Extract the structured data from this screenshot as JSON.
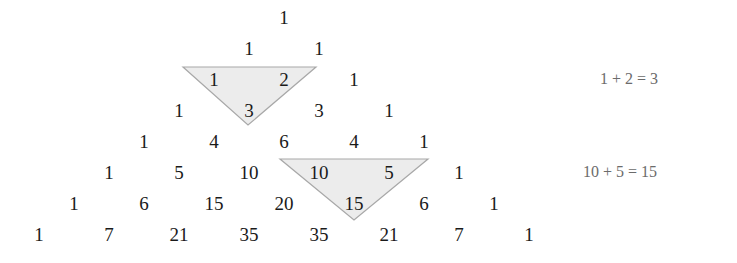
{
  "diagram": {
    "title": "",
    "triangle_rows": [
      [
        "1"
      ],
      [
        "1",
        "1"
      ],
      [
        "1",
        "2",
        "1"
      ],
      [
        "1",
        "3",
        "3",
        "1"
      ],
      [
        "1",
        "4",
        "6",
        "4",
        "1"
      ],
      [
        "1",
        "5",
        "10",
        "10",
        "5",
        "1"
      ],
      [
        "1",
        "6",
        "15",
        "20",
        "15",
        "6",
        "1"
      ],
      [
        "1",
        "7",
        "21",
        "35",
        "35",
        "21",
        "7",
        "1"
      ]
    ],
    "highlights": [
      {
        "label": "highlight-1-2-3",
        "cells": [
          [
            2,
            0
          ],
          [
            2,
            1
          ],
          [
            3,
            1
          ]
        ],
        "fill": "#ececec",
        "stroke": "#a8a8a8"
      },
      {
        "label": "highlight-10-5-15",
        "cells": [
          [
            5,
            3
          ],
          [
            5,
            4
          ],
          [
            6,
            4
          ]
        ],
        "fill": "#ececec",
        "stroke": "#a8a8a8"
      }
    ],
    "equations": [
      {
        "text": "1 + 2 = 3",
        "row": 2
      },
      {
        "text": "10 + 5 = 15",
        "row": 5
      }
    ]
  }
}
